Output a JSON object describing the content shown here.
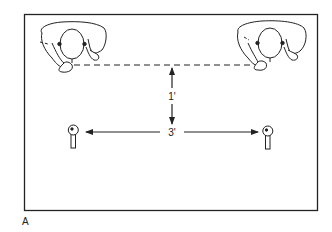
{
  "figure": {
    "panel_label": "A",
    "colors": {
      "ink": "#222222",
      "background": "#ffffff"
    },
    "dimensions": {
      "vertical": {
        "label": "1'",
        "meaning": "distance from speakers' line to microphones"
      },
      "horizontal": {
        "label": "3'",
        "meaning": "distance between microphones"
      }
    },
    "elements": [
      {
        "name": "person-left",
        "description": "top-down view of seated person"
      },
      {
        "name": "person-right",
        "description": "top-down view of seated person"
      },
      {
        "name": "microphone-left",
        "description": "microphone"
      },
      {
        "name": "microphone-right",
        "description": "microphone"
      }
    ]
  }
}
